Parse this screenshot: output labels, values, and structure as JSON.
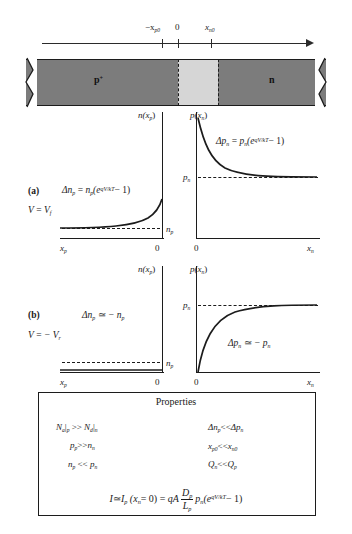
{
  "figure": {
    "title_hidden": "",
    "axis": {
      "ticks": [
        {
          "label_prefix": "−",
          "base": "x",
          "sub": "p0"
        },
        {
          "label_prefix": "",
          "base": "0",
          "sub": ""
        },
        {
          "label_prefix": "",
          "base": "x",
          "sub": "n0"
        }
      ],
      "tick_labels": [
        "−x",
        "0",
        "x"
      ],
      "tick_subs": [
        "p0",
        "",
        "n0"
      ]
    },
    "bar": {
      "left_region_label": "p",
      "left_region_sup": "+",
      "right_region_label": "n",
      "depletion_label": ""
    },
    "axis_titles": {
      "left": "n(x",
      "left_sub": "p",
      "left_close": ")",
      "right": "p(x",
      "right_sub": "n",
      "right_close": ")"
    },
    "panels": [
      {
        "id": "(a)",
        "bias_prefix": "V",
        "bias_eq": "=",
        "bias_value": "V",
        "bias_sub": "f",
        "left": {
          "equation_lhs": "Δn",
          "equation_lhs_sub": "p",
          "equation_rel": "=",
          "equation_rhs_base": "n",
          "equation_rhs_sub": "p",
          "equation_rhs_tail": "(e",
          "equation_exp": "qV/kT",
          "equation_end": "− 1)",
          "axis_x_label": "x",
          "axis_x_sub": "p",
          "axis_origin": "0",
          "level_label": "n",
          "level_sub": "p",
          "curve_shape": "exponential-rise"
        },
        "right": {
          "equation_lhs": "Δp",
          "equation_lhs_sub": "n",
          "equation_rel": "=",
          "equation_rhs_base": "p",
          "equation_rhs_sub": "n",
          "equation_rhs_tail": "(e",
          "equation_exp": "qV/kT",
          "equation_end": "− 1)",
          "axis_x_label": "x",
          "axis_x_sub": "n",
          "axis_origin": "0",
          "level_label": "p",
          "level_sub": "n",
          "curve_shape": "exponential-decay"
        }
      },
      {
        "id": "(b)",
        "bias_prefix": "V",
        "bias_eq": "=",
        "bias_value": "− V",
        "bias_sub": "r",
        "left": {
          "equation_lhs": "Δn",
          "equation_lhs_sub": "p",
          "equation_rel": "≃",
          "equation_rhs_base": "− n",
          "equation_rhs_sub": "p",
          "equation_rhs_tail": "",
          "equation_exp": "",
          "equation_end": "",
          "axis_x_label": "x",
          "axis_x_sub": "p",
          "axis_origin": "0",
          "level_label": "n",
          "level_sub": "p",
          "curve_shape": "flat-zero"
        },
        "right": {
          "equation_lhs": "Δp",
          "equation_lhs_sub": "n",
          "equation_rel": "≃",
          "equation_rhs_base": "− p",
          "equation_rhs_sub": "n",
          "equation_rhs_tail": "",
          "equation_exp": "",
          "equation_end": "",
          "axis_x_label": "x",
          "axis_x_sub": "n",
          "axis_origin": "0",
          "level_label": "p",
          "level_sub": "n",
          "curve_shape": "saturating-rise"
        }
      }
    ],
    "properties": {
      "title": "Properties",
      "left_column": [
        {
          "a": "N",
          "a_sub": "a",
          "a_bar": "|",
          "a_bar_sub": "p",
          "rel": ">>",
          "b": "N",
          "b_sub": "d",
          "b_bar": "|",
          "b_bar_sub": "n"
        },
        {
          "a": "p",
          "a_sub": "p",
          "a_bar": "",
          "a_bar_sub": "",
          "rel": ">>",
          "b": "n",
          "b_sub": "n",
          "b_bar": "",
          "b_bar_sub": ""
        },
        {
          "a": "n",
          "a_sub": "p",
          "a_bar": "",
          "a_bar_sub": "",
          "rel": "<<",
          "b": "p",
          "b_sub": "n",
          "b_bar": "",
          "b_bar_sub": ""
        }
      ],
      "right_column": [
        {
          "a": "Δn",
          "a_sub": "p",
          "rel": "<<",
          "b": "Δp",
          "b_sub": "n"
        },
        {
          "a": "x",
          "a_sub": "p0",
          "rel": "<<",
          "b": "x",
          "b_sub": "n0"
        },
        {
          "a": "Q",
          "a_sub": "n",
          "rel": "<<",
          "b": "Q",
          "b_sub": "p"
        }
      ],
      "current_equation": {
        "lhs": "I",
        "approx": "≃",
        "ip": "I",
        "ip_sub": "p",
        "arg_open": "(x",
        "arg_sub": "n",
        "arg_eq": "= 0)",
        "equals": "=",
        "qa": "qA",
        "frac_num": "D",
        "frac_num_sub": "p",
        "frac_den": "L",
        "frac_den_sub": "p",
        "pn": "p",
        "pn_sub": "n",
        "tail_open": "(e",
        "exp": "qV/kT",
        "tail_end": "− 1)"
      }
    },
    "colors": {
      "neutral_region": "#7c7c7c",
      "depletion_region": "#d6d6d6",
      "ink": "#1c1c1c",
      "background": "#ffffff"
    }
  }
}
